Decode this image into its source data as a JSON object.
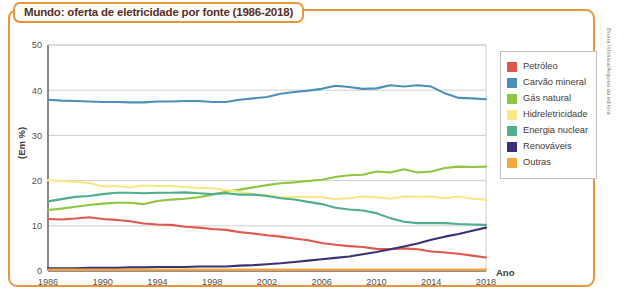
{
  "figure": {
    "title": "Mundo: oferta de eletricidade por fonte (1986-2018)",
    "credit": "Bruna Ishihara/Arquivo da editora",
    "frame_color": "#E8963C",
    "title_color": "#5A2D23"
  },
  "axes": {
    "y_label": "(Em %)",
    "x_label": "Ano"
  },
  "legend": {
    "items": [
      {
        "label": "Petróleo",
        "color": "#E2574C"
      },
      {
        "label": "Carvão mineral",
        "color": "#4A90B8"
      },
      {
        "label": "Gás natural",
        "color": "#8DC63F"
      },
      {
        "label": "Hidreletricidade",
        "color": "#F7E98A"
      },
      {
        "label": "Energia nuclear",
        "color": "#4FAE8B"
      },
      {
        "label": "Renováveis",
        "color": "#3B3178"
      },
      {
        "label": "Outras",
        "color": "#F5A63C"
      }
    ]
  },
  "chart_data": {
    "type": "line",
    "title": "Mundo: oferta de eletricidade por fonte (1986-2018)",
    "xlabel": "Ano",
    "ylabel": "(Em %)",
    "xlim": [
      1986,
      2018
    ],
    "ylim": [
      0,
      50
    ],
    "yticks": [
      0,
      10,
      20,
      30,
      40,
      50
    ],
    "xticks": [
      1986,
      1990,
      1994,
      1998,
      2002,
      2006,
      2010,
      2014,
      2018
    ],
    "grid": "horizontal",
    "legend_position": "right",
    "x": [
      1986,
      1987,
      1988,
      1989,
      1990,
      1991,
      1992,
      1993,
      1994,
      1995,
      1996,
      1997,
      1998,
      1999,
      2000,
      2001,
      2002,
      2003,
      2004,
      2005,
      2006,
      2007,
      2008,
      2009,
      2010,
      2011,
      2012,
      2013,
      2014,
      2015,
      2016,
      2017,
      2018
    ],
    "series": [
      {
        "name": "Petróleo",
        "color": "#E2574C",
        "values": [
          11.5,
          11.4,
          11.6,
          11.9,
          11.5,
          11.3,
          11.0,
          10.5,
          10.3,
          10.2,
          9.8,
          9.6,
          9.3,
          9.1,
          8.6,
          8.3,
          7.9,
          7.6,
          7.2,
          6.8,
          6.2,
          5.8,
          5.5,
          5.3,
          4.9,
          4.8,
          5.0,
          4.8,
          4.3,
          4.1,
          3.8,
          3.4,
          3.0
        ]
      },
      {
        "name": "Carvão mineral",
        "color": "#4A90B8",
        "values": [
          37.9,
          37.7,
          37.6,
          37.5,
          37.4,
          37.4,
          37.3,
          37.3,
          37.5,
          37.5,
          37.6,
          37.6,
          37.4,
          37.4,
          37.9,
          38.2,
          38.5,
          39.2,
          39.6,
          39.9,
          40.3,
          41.0,
          40.7,
          40.3,
          40.4,
          41.1,
          40.8,
          41.1,
          40.8,
          39.3,
          38.3,
          38.2,
          38.0
        ]
      },
      {
        "name": "Gás natural",
        "color": "#8DC63F",
        "values": [
          13.5,
          13.8,
          14.2,
          14.6,
          14.9,
          15.1,
          15.1,
          14.8,
          15.5,
          15.8,
          16.0,
          16.3,
          16.9,
          17.5,
          18.0,
          18.5,
          19.0,
          19.4,
          19.6,
          19.9,
          20.2,
          20.8,
          21.2,
          21.3,
          22.0,
          21.8,
          22.5,
          21.8,
          22.0,
          22.8,
          23.1,
          23.0,
          23.1
        ]
      },
      {
        "name": "Hidreletricidade",
        "color": "#F7E98A",
        "values": [
          20.1,
          19.9,
          19.7,
          19.5,
          18.7,
          18.8,
          18.5,
          18.9,
          18.8,
          18.8,
          18.6,
          18.4,
          18.3,
          17.9,
          17.5,
          17.0,
          16.8,
          16.3,
          16.4,
          16.4,
          16.3,
          15.9,
          16.1,
          16.5,
          16.3,
          16.0,
          16.5,
          16.4,
          16.5,
          16.1,
          16.5,
          16.0,
          15.8
        ]
      },
      {
        "name": "Energia nuclear",
        "color": "#4FAE8B",
        "values": [
          15.4,
          15.9,
          16.4,
          16.6,
          17.0,
          17.3,
          17.3,
          17.2,
          17.3,
          17.3,
          17.4,
          17.2,
          17.0,
          17.2,
          16.9,
          16.9,
          16.6,
          16.1,
          15.8,
          15.3,
          14.8,
          14.0,
          13.6,
          13.4,
          12.8,
          11.7,
          10.9,
          10.6,
          10.6,
          10.6,
          10.4,
          10.3,
          10.2
        ]
      },
      {
        "name": "Renováveis",
        "color": "#3B3178",
        "values": [
          0.6,
          0.6,
          0.6,
          0.7,
          0.7,
          0.7,
          0.8,
          0.8,
          0.9,
          0.9,
          0.9,
          1.0,
          1.0,
          1.0,
          1.2,
          1.3,
          1.5,
          1.7,
          2.0,
          2.3,
          2.6,
          2.9,
          3.2,
          3.7,
          4.2,
          4.8,
          5.4,
          6.1,
          6.9,
          7.6,
          8.2,
          8.9,
          9.6
        ]
      },
      {
        "name": "Outras",
        "color": "#F5A63C",
        "values": [
          0.3,
          0.3,
          0.3,
          0.3,
          0.3,
          0.3,
          0.3,
          0.3,
          0.3,
          0.3,
          0.3,
          0.3,
          0.3,
          0.3,
          0.3,
          0.3,
          0.3,
          0.3,
          0.3,
          0.3,
          0.3,
          0.3,
          0.3,
          0.3,
          0.3,
          0.3,
          0.3,
          0.3,
          0.3,
          0.3,
          0.3,
          0.3,
          0.3
        ]
      }
    ]
  }
}
